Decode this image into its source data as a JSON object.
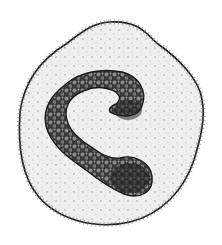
{
  "image": {
    "description": "Stippled black-and-white illustration of a blood cell with a C-shaped (band) granular nucleus",
    "subject": "cell with band-shaped nucleus",
    "style": "pen-and-ink stipple drawing",
    "colors": {
      "background": "#ffffff",
      "cytoplasm": "#efefef",
      "outline": "#1a1a1a",
      "nucleus_dark": "#2a2a2a",
      "nucleus_light": "#8a8a8a",
      "stipple": "#333333"
    }
  }
}
